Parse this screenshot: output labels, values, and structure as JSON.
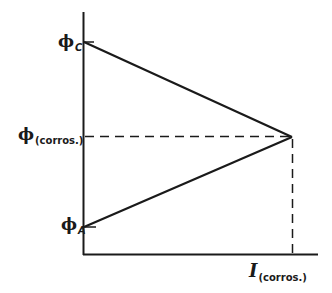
{
  "diagram": {
    "type": "evans-corrosion-diagram",
    "y_axis": {
      "labels": {
        "phi_c": {
          "symbol": "ϕ",
          "subscript": "C"
        },
        "phi_corros": {
          "symbol": "ϕ",
          "subscript": "(corros.)"
        },
        "phi_a": {
          "symbol": "ϕ",
          "subscript": "A"
        }
      }
    },
    "x_axis": {
      "label": {
        "symbol": "I",
        "subscript": "(corros.)"
      }
    },
    "lines": [
      {
        "name": "cathodic-line",
        "from": "phi_c",
        "to": "corrosion-point",
        "style": "solid"
      },
      {
        "name": "anodic-line",
        "from": "phi_a",
        "to": "corrosion-point",
        "style": "solid"
      },
      {
        "name": "corrosion-potential-guide",
        "from": "y-axis",
        "to": "corrosion-point",
        "style": "dashed"
      },
      {
        "name": "corrosion-current-guide",
        "from": "corrosion-point",
        "to": "x-axis",
        "style": "dashed"
      }
    ],
    "colors": {
      "ink": "#1a1a1a",
      "background": "#ffffff"
    }
  }
}
